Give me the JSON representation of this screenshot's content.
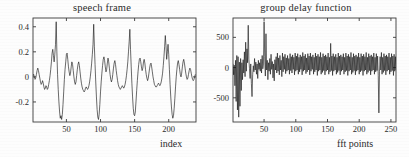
{
  "figure": {
    "background_color": "#fdfdfd",
    "axis_color": "#3a3a3a",
    "trace_color": "#1a1a1a"
  },
  "chart_data": [
    {
      "type": "line",
      "panel": "left",
      "title": "speech frame",
      "xlabel": "index",
      "ylabel": "",
      "xlim": [
        1,
        240
      ],
      "ylim": [
        -0.36,
        0.47
      ],
      "xticks": [
        50,
        100,
        150,
        200
      ],
      "yticks": [
        -0.2,
        0,
        0.2,
        0.4
      ],
      "xticklabels": [
        "50",
        "100",
        "150",
        "200"
      ],
      "yticklabels": [
        "-0.2",
        "0",
        "0.2",
        "0.4"
      ],
      "grid": false,
      "legend": "none",
      "x": [
        1,
        2,
        3,
        4,
        5,
        6,
        7,
        8,
        9,
        10,
        11,
        12,
        13,
        14,
        15,
        16,
        17,
        18,
        19,
        20,
        21,
        22,
        23,
        24,
        25,
        26,
        27,
        28,
        29,
        30,
        31,
        32,
        33,
        34,
        35,
        36,
        37,
        38,
        39,
        40,
        41,
        42,
        43,
        44,
        45,
        46,
        47,
        48,
        49,
        50,
        51,
        52,
        53,
        54,
        55,
        56,
        57,
        58,
        59,
        60,
        61,
        62,
        63,
        64,
        65,
        66,
        67,
        68,
        69,
        70,
        71,
        72,
        73,
        74,
        75,
        76,
        77,
        78,
        79,
        80,
        81,
        82,
        83,
        84,
        85,
        86,
        87,
        88,
        89,
        90,
        91,
        92,
        93,
        94,
        95,
        96,
        97,
        98,
        99,
        100,
        101,
        102,
        103,
        104,
        105,
        106,
        107,
        108,
        109,
        110,
        111,
        112,
        113,
        114,
        115,
        116,
        117,
        118,
        119,
        120,
        121,
        122,
        123,
        124,
        125,
        126,
        127,
        128,
        129,
        130,
        131,
        132,
        133,
        134,
        135,
        136,
        137,
        138,
        139,
        140,
        141,
        142,
        143,
        144,
        145,
        146,
        147,
        148,
        149,
        150,
        151,
        152,
        153,
        154,
        155,
        156,
        157,
        158,
        159,
        160,
        161,
        162,
        163,
        164,
        165,
        166,
        167,
        168,
        169,
        170,
        171,
        172,
        173,
        174,
        175,
        176,
        177,
        178,
        179,
        180,
        181,
        182,
        183,
        184,
        185,
        186,
        187,
        188,
        189,
        190,
        191,
        192,
        193,
        194,
        195,
        196,
        197,
        198,
        199,
        200,
        201,
        202,
        203,
        204,
        205,
        206,
        207,
        208,
        209,
        210,
        211,
        212,
        213,
        214,
        215,
        216,
        217,
        218,
        219,
        220,
        221,
        222,
        223,
        224,
        225,
        226,
        227,
        228,
        229,
        230,
        231,
        232,
        233,
        234,
        235,
        236,
        237,
        238,
        239,
        240
      ],
      "values": [
        0.01,
        0.02,
        0.0,
        -0.02,
        -0.01,
        0.02,
        0.05,
        0.07,
        0.05,
        0.02,
        -0.01,
        -0.04,
        -0.06,
        -0.05,
        -0.03,
        -0.05,
        -0.08,
        -0.1,
        -0.09,
        -0.07,
        -0.08,
        -0.1,
        -0.09,
        -0.06,
        -0.03,
        0.01,
        0.06,
        0.12,
        0.19,
        0.22,
        0.17,
        0.12,
        0.18,
        0.26,
        0.44,
        0.2,
        0.02,
        -0.1,
        -0.2,
        -0.28,
        -0.33,
        -0.31,
        -0.34,
        -0.3,
        -0.22,
        -0.12,
        -0.02,
        0.06,
        0.12,
        0.18,
        0.19,
        0.14,
        0.08,
        0.04,
        0.01,
        0.03,
        0.08,
        0.12,
        0.1,
        0.05,
        0.0,
        -0.04,
        -0.06,
        -0.04,
        0.01,
        0.06,
        0.1,
        0.12,
        0.09,
        0.04,
        -0.01,
        -0.05,
        -0.08,
        -0.1,
        -0.11,
        -0.12,
        -0.11,
        -0.09,
        -0.08,
        -0.09,
        -0.1,
        -0.09,
        -0.07,
        -0.04,
        0.0,
        0.05,
        0.11,
        0.18,
        0.26,
        0.42,
        0.24,
        0.1,
        -0.04,
        -0.16,
        -0.26,
        -0.32,
        -0.34,
        -0.3,
        -0.22,
        -0.12,
        -0.04,
        0.03,
        0.09,
        0.14,
        0.16,
        0.13,
        0.08,
        0.04,
        0.06,
        0.11,
        0.15,
        0.12,
        0.07,
        0.02,
        -0.02,
        -0.04,
        -0.02,
        0.02,
        0.07,
        0.11,
        0.13,
        0.1,
        0.05,
        0.01,
        -0.03,
        -0.06,
        -0.08,
        -0.09,
        -0.1,
        -0.09,
        -0.08,
        -0.07,
        -0.08,
        -0.09,
        -0.08,
        -0.06,
        -0.03,
        0.01,
        0.06,
        0.12,
        0.2,
        0.28,
        0.38,
        0.22,
        0.08,
        -0.05,
        -0.16,
        -0.25,
        -0.3,
        -0.31,
        -0.28,
        -0.2,
        -0.11,
        -0.03,
        0.04,
        0.1,
        0.14,
        0.15,
        0.12,
        0.08,
        0.05,
        0.07,
        0.12,
        0.14,
        0.11,
        0.06,
        0.02,
        -0.01,
        -0.03,
        -0.01,
        0.03,
        0.07,
        0.1,
        0.11,
        0.08,
        0.04,
        0.0,
        -0.03,
        -0.06,
        -0.07,
        -0.08,
        -0.08,
        -0.07,
        -0.06,
        -0.05,
        -0.06,
        -0.07,
        -0.06,
        -0.04,
        -0.01,
        0.03,
        0.09,
        0.16,
        0.24,
        0.33,
        0.25,
        0.14,
        0.2,
        0.26,
        0.18,
        0.06,
        -0.06,
        -0.16,
        -0.24,
        -0.3,
        -0.33,
        -0.31,
        -0.25,
        -0.17,
        -0.08,
        0.0,
        0.06,
        0.11,
        0.13,
        0.1,
        0.06,
        0.02,
        0.0,
        0.03,
        0.08,
        0.12,
        0.14,
        0.11,
        0.07,
        0.03,
        0.0,
        -0.02,
        -0.01,
        0.02,
        0.05,
        0.07,
        0.06,
        0.03,
        0.0,
        -0.02,
        -0.03,
        -0.02,
        0.0,
        0.02
      ]
    },
    {
      "type": "line",
      "panel": "right",
      "title": "group delay function",
      "xlabel": "fft points",
      "ylabel": "",
      "xlim": [
        1,
        258
      ],
      "ylim": [
        -900,
        820
      ],
      "xticks": [
        50,
        100,
        150,
        200,
        250
      ],
      "yticks": [
        -500,
        0,
        500
      ],
      "xticklabels": [
        "50",
        "100",
        "150",
        "200",
        "250"
      ],
      "yticklabels": [
        "-500",
        "0",
        "500"
      ],
      "grid": false,
      "legend": "none",
      "x": [
        1,
        2,
        3,
        4,
        5,
        6,
        7,
        8,
        9,
        10,
        11,
        12,
        13,
        14,
        15,
        16,
        17,
        18,
        19,
        20,
        21,
        22,
        23,
        24,
        25,
        26,
        27,
        28,
        29,
        30,
        31,
        32,
        33,
        34,
        35,
        36,
        37,
        38,
        39,
        40,
        41,
        42,
        43,
        44,
        45,
        46,
        47,
        48,
        49,
        50,
        51,
        52,
        53,
        54,
        55,
        56,
        57,
        58,
        59,
        60,
        61,
        62,
        63,
        64,
        65,
        66,
        67,
        68,
        69,
        70,
        71,
        72,
        73,
        74,
        75,
        76,
        77,
        78,
        79,
        80,
        81,
        82,
        83,
        84,
        85,
        86,
        87,
        88,
        89,
        90,
        91,
        92,
        93,
        94,
        95,
        96,
        97,
        98,
        99,
        100,
        101,
        102,
        103,
        104,
        105,
        106,
        107,
        108,
        109,
        110,
        111,
        112,
        113,
        114,
        115,
        116,
        117,
        118,
        119,
        120,
        121,
        122,
        123,
        124,
        125,
        126,
        127,
        128,
        129,
        130,
        131,
        132,
        133,
        134,
        135,
        136,
        137,
        138,
        139,
        140,
        141,
        142,
        143,
        144,
        145,
        146,
        147,
        148,
        149,
        150,
        151,
        152,
        153,
        154,
        155,
        156,
        157,
        158,
        159,
        160,
        161,
        162,
        163,
        164,
        165,
        166,
        167,
        168,
        169,
        170,
        171,
        172,
        173,
        174,
        175,
        176,
        177,
        178,
        179,
        180,
        181,
        182,
        183,
        184,
        185,
        186,
        187,
        188,
        189,
        190,
        191,
        192,
        193,
        194,
        195,
        196,
        197,
        198,
        199,
        200,
        201,
        202,
        203,
        204,
        205,
        206,
        207,
        208,
        209,
        210,
        211,
        212,
        213,
        214,
        215,
        216,
        217,
        218,
        219,
        220,
        221,
        222,
        223,
        224,
        225,
        226,
        227,
        228,
        229,
        230,
        231,
        232,
        233,
        234,
        235,
        236,
        237,
        238,
        239,
        240,
        241,
        242,
        243,
        244,
        245,
        246,
        247,
        248,
        249,
        250,
        251,
        252,
        253,
        254,
        255,
        256,
        257,
        258
      ],
      "values": [
        60,
        -120,
        40,
        -300,
        120,
        -560,
        200,
        -700,
        180,
        -820,
        90,
        -640,
        150,
        -380,
        80,
        -200,
        130,
        -90,
        260,
        -150,
        420,
        -60,
        310,
        80,
        700,
        140,
        -20,
        -180,
        60,
        -260,
        -480,
        -120,
        30,
        -70,
        150,
        -40,
        90,
        -110,
        60,
        -180,
        120,
        -30,
        80,
        -60,
        140,
        -90,
        200,
        -20,
        60,
        760,
        180,
        -140,
        560,
        -40,
        120,
        -200,
        80,
        -60,
        150,
        -110,
        220,
        -30,
        100,
        -170,
        60,
        -220,
        130,
        -40,
        180,
        -90,
        240,
        -60,
        160,
        -120,
        200,
        -40,
        120,
        -150,
        240,
        -70,
        180,
        -30,
        220,
        -100,
        160,
        -60,
        200,
        -40,
        150,
        -110,
        230,
        -50,
        180,
        -90,
        210,
        -30,
        170,
        -120,
        240,
        -60,
        190,
        -40,
        230,
        -110,
        170,
        -70,
        210,
        -30,
        180,
        -120,
        250,
        -60,
        190,
        -40,
        220,
        -100,
        160,
        -70,
        230,
        -40,
        190,
        -120,
        240,
        -60,
        180,
        -30,
        210,
        -110,
        170,
        -70,
        240,
        -40,
        190,
        -130,
        220,
        -60,
        180,
        -40,
        250,
        -110,
        170,
        -80,
        230,
        -50,
        190,
        -120,
        210,
        -60,
        180,
        -40,
        240,
        -110,
        170,
        -70,
        400,
        -50,
        190,
        -130,
        230,
        -60,
        180,
        -40,
        220,
        -110,
        170,
        -80,
        240,
        -50,
        190,
        -120,
        210,
        -60,
        180,
        -40,
        230,
        -110,
        170,
        -70,
        240,
        -50,
        190,
        -130,
        220,
        -60,
        180,
        -40,
        250,
        -110,
        170,
        -80,
        230,
        -50,
        190,
        -120,
        210,
        -60,
        180,
        -40,
        240,
        -110,
        170,
        -70,
        230,
        -50,
        190,
        -130,
        220,
        -60,
        180,
        -40,
        250,
        -110,
        170,
        -80,
        230,
        -50,
        190,
        -120,
        210,
        -60,
        180,
        -40,
        240,
        -110,
        170,
        -70,
        230,
        -50,
        190,
        -130,
        -750,
        -60,
        180,
        -40,
        250,
        -110,
        170,
        -80,
        230,
        -50,
        190,
        -120,
        210,
        -60,
        180,
        -40,
        240,
        -110,
        170,
        -70,
        230,
        -50,
        190,
        -130,
        220,
        -60,
        180,
        -40,
        250,
        -110,
        170,
        -80,
        230,
        -50,
        190,
        -120,
        210,
        -60,
        180,
        -40,
        90
      ]
    }
  ]
}
